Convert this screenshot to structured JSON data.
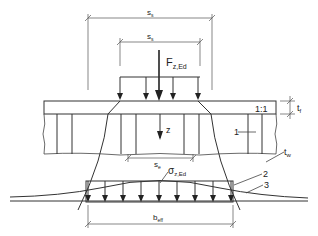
{
  "diagram": {
    "type": "structural detail: patch load dispersion into girder web",
    "labels": {
      "ss_outer": "s",
      "ss_outer_sub": "s",
      "ss_inner": "s",
      "ss_inner_sub": "s",
      "force": "F",
      "force_sub": "z,Ed",
      "slope": "1:1",
      "tf": "t",
      "tf_sub": "f",
      "tw": "t",
      "tw_sub": "w",
      "z_axis": "z",
      "se": "s",
      "se_sub": "e",
      "stress": "σ",
      "stress_sub": "z,Ed",
      "beff": "b",
      "beff_sub": "eff",
      "callout_1": "1",
      "callout_2": "2",
      "callout_3": "3"
    },
    "colors": {
      "line": "#333333",
      "background": "#ffffff"
    }
  }
}
